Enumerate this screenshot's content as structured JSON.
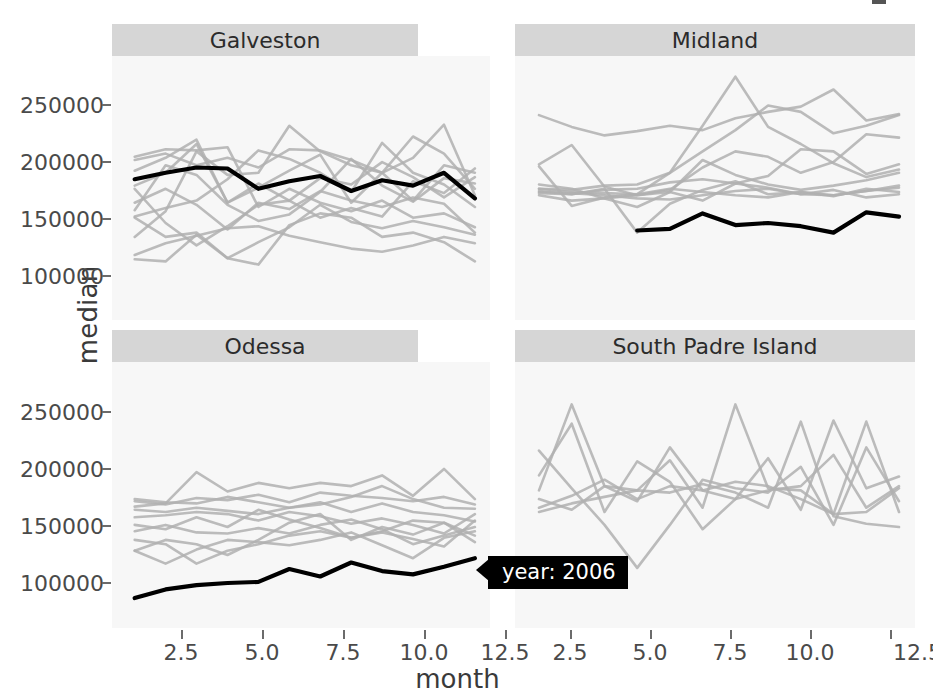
{
  "axes": {
    "ylabel": "median",
    "xlabel": "month",
    "yticks": [
      "250000",
      "200000",
      "150000",
      "100000"
    ],
    "xticks_left": [
      "2.5",
      "5.0",
      "7.5",
      "10.0",
      "12.5"
    ],
    "xticks_right": [
      "2.5",
      "5.0",
      "7.5",
      "10.0",
      "12.5"
    ]
  },
  "tooltip": {
    "label": "year: 2006"
  },
  "panels": [
    {
      "title": "Galveston"
    },
    {
      "title": "Midland"
    },
    {
      "title": "Odessa"
    },
    {
      "title": "South Padre Island"
    }
  ],
  "colors": {
    "highlight": "#000000",
    "background_series": "#b0b0b0",
    "panel_bg": "#f7f7f7",
    "strip_bg": "#d6d6d6",
    "tooltip_bg": "#000000",
    "tooltip_text": "#ffffff",
    "axis_text": "#4a4a4a"
  },
  "chart_data": {
    "type": "line",
    "title": "",
    "xlabel": "month",
    "ylabel": "median",
    "xlim": [
      1,
      12
    ],
    "ylim": [
      55000,
      275000
    ],
    "grid": false,
    "legend_position": "none",
    "facet_layout": "2x2",
    "highlight_series": "year: 2006",
    "annotations": [
      {
        "text": "year: 2006",
        "panel": "Odessa",
        "x": 12,
        "y": 105000
      }
    ],
    "x": [
      1,
      2,
      3,
      4,
      5,
      6,
      7,
      8,
      9,
      10,
      11,
      12
    ],
    "facets": [
      {
        "name": "Galveston",
        "highlight": {
          "name": "2006",
          "values": [
            172000,
            178000,
            183000,
            182000,
            163000,
            170000,
            175000,
            161000,
            171000,
            166000,
            178000,
            154000
          ]
        },
        "series": [
          {
            "name": "2000",
            "values": [
              97000,
              95000,
              120000,
              98000,
              92000,
              129000,
              140000,
              136000,
              118000,
              122000,
              113000,
              95000
            ]
          },
          {
            "name": "2001",
            "values": [
              136000,
              118000,
              122000,
              98000,
              113000,
              127000,
              148000,
              132000,
              126000,
              133000,
              127000,
              120000
            ]
          },
          {
            "name": "2002",
            "values": [
              101000,
              112000,
              119000,
              126000,
              128000,
              119000,
              113000,
              107000,
              104000,
              110000,
              118000,
              112000
            ]
          },
          {
            "name": "2003",
            "values": [
              150000,
              163000,
              148000,
              125000,
              150000,
              144000,
              161000,
              152000,
              146000,
              155000,
              149000,
              122000
            ]
          },
          {
            "name": "2004",
            "values": [
              166000,
              178000,
              205000,
              150000,
              164000,
              180000,
              195000,
              150000,
              178000,
              152000,
              185000,
              178000
            ]
          },
          {
            "name": "2005",
            "values": [
              190000,
              196000,
              185000,
              192000,
              183000,
              200000,
              199000,
              190000,
              178000,
              212000,
              196000,
              163000
            ]
          },
          {
            "name": "2007",
            "values": [
              137000,
              145000,
              152000,
              172000,
              199000,
              191000,
              178000,
              160000,
              206000,
              178000,
              167000,
              146000
            ]
          },
          {
            "name": "2008",
            "values": [
              118000,
              142000,
              198000,
              176000,
              178000,
              222000,
              198000,
              185000,
              178000,
              192000,
              223000,
              157000
            ]
          },
          {
            "name": "2009",
            "values": [
              193000,
              200000,
              199000,
              202000,
              146000,
              163000,
              150000,
              142000,
              152000,
              136000,
              140000,
              127000
            ]
          },
          {
            "name": "2010",
            "values": [
              143000,
              185000,
              176000,
              148000,
              133000,
              139000,
              160000,
              191000,
              166000,
              151000,
              173000,
              168000
            ]
          },
          {
            "name": "2011",
            "values": [
              163000,
              131000,
              110000,
              128000,
              148000,
              152000,
              136000,
              145000,
              137000,
              170000,
              159000,
              182000
            ]
          },
          {
            "name": "2012",
            "values": [
              180000,
              192000,
              209000,
              150000,
              168000,
              152000,
              173000,
              167000,
              188000,
              174000,
              155000,
              174000
            ]
          }
        ]
      },
      {
        "name": "Midland",
        "highlight": {
          "name": "2006",
          "values": [
            null,
            null,
            null,
            124000,
            125500,
            140000,
            129000,
            131000,
            128000,
            122000,
            141000,
            137000
          ]
        },
        "series": [
          {
            "name": "2000",
            "values": [
              163000,
              160000,
              159000,
              158000,
              178000,
              198000,
              218000,
              241000,
              235000,
              215000,
              222000,
              232000
            ]
          },
          {
            "name": "2001",
            "values": [
              232000,
              221000,
              213000,
              217000,
              222000,
              218000,
              229000,
              235000,
              240000,
              256000,
              227000,
              233000
            ]
          },
          {
            "name": "2002",
            "values": [
              186000,
              204000,
              165000,
              157000,
              162000,
              183000,
              198000,
              193000,
              178000,
              188000,
              214000,
              211000
            ]
          },
          {
            "name": "2003",
            "values": [
              163000,
              162000,
              166000,
              167000,
              178000,
              222000,
              268000,
              221000,
              205000,
              187000,
              174000,
              181000
            ]
          },
          {
            "name": "2004",
            "values": [
              167000,
              163000,
              154000,
              146000,
              160000,
              190000,
              176000,
              167000,
              162000,
              166000,
              171000,
              178000
            ]
          },
          {
            "name": "2005",
            "values": [
              161000,
              158000,
              162000,
              163000,
              169000,
              172000,
              168000,
              175000,
              200000,
              198000,
              177000,
              186000
            ]
          },
          {
            "name": "2007",
            "values": [
              160000,
              159000,
              157000,
              154000,
              153000,
              157000,
              161000,
              163000,
              158000,
              157000,
              161000,
              164000
            ]
          },
          {
            "name": "2008",
            "values": [
              184000,
              147000,
              155000,
              158000,
              163000,
              160000,
              157000,
              155000,
              160000,
              156000,
              163000,
              160000
            ]
          },
          {
            "name": "2009",
            "values": [
              159000,
              158000,
              163000,
              122000,
              149000,
              162000,
              170000,
              158000,
              160000,
              157000,
              161000,
              166000
            ]
          },
          {
            "name": "2010",
            "values": [
              157000,
              152000,
              154000,
              157000,
              160000,
              152000,
              168000,
              164000,
              158000,
              162000,
              155000,
              158000
            ]
          }
        ]
      },
      {
        "name": "Odessa",
        "highlight": {
          "name": "2006",
          "values": [
            68000,
            76000,
            80000,
            82000,
            83000,
            95000,
            88000,
            101000,
            93000,
            90000,
            97000,
            105000
          ]
        },
        "series": [
          {
            "name": "2000",
            "values": [
              112000,
              100000,
              113000,
              122000,
              120000,
              117000,
              122000,
              129000,
              117000,
              105000,
              124000,
              130000
            ]
          },
          {
            "name": "2001",
            "values": [
              122000,
              118000,
              100000,
              112000,
              118000,
              126000,
              130000,
              124000,
              129000,
              123000,
              116000,
              140000
            ]
          },
          {
            "name": "2002",
            "values": [
              130000,
              136000,
              129000,
              128000,
              133000,
              128000,
              136000,
              141000,
              132000,
              118000,
              126000,
              134000
            ]
          },
          {
            "name": "2003",
            "values": [
              136000,
              132000,
              143000,
              134000,
              150000,
              141000,
              133000,
              124000,
              130000,
              140000,
              138000,
              126000
            ]
          },
          {
            "name": "2004",
            "values": [
              143000,
              145000,
              148000,
              146000,
              140000,
              148000,
              144000,
              137000,
              142000,
              136000,
              128000,
              146000
            ]
          },
          {
            "name": "2005",
            "values": [
              150000,
              148000,
              152000,
              149000,
              146000,
              152000,
              157000,
              148000,
              156000,
              148000,
              145000,
              139000
            ]
          },
          {
            "name": "2007",
            "values": [
              158000,
              155000,
              161000,
              159000,
              164000,
              157000,
              166000,
              163000,
              161000,
              158000,
              162000,
              155000
            ]
          },
          {
            "name": "2008",
            "values": [
              153000,
              156000,
              185000,
              167000,
              175000,
              170000,
              175000,
              172000,
              182000,
              163000,
              188000,
              160000
            ]
          },
          {
            "name": "2009",
            "values": [
              160000,
              157000,
              156000,
              162000,
              157000,
              152000,
              155000,
              162000,
              172000,
              160000,
              152000,
              151000
            ]
          },
          {
            "name": "2010",
            "values": [
              112000,
              122000,
              118000,
              108000,
              122000,
              138000,
              146000,
              122000,
              134000,
              127000,
              138000,
              120000
            ]
          }
        ]
      },
      {
        "name": "South Padre Island",
        "highlight": null,
        "series": [
          {
            "name": "2000",
            "values": [
              168000,
              248000,
              172000,
              168000,
              196000,
              152000,
              248000,
              170000,
              168000,
              146000,
              232000,
              148000
            ]
          },
          {
            "name": "2001",
            "values": [
              205000,
              170000,
              136000,
              96000,
              136000,
              178000,
              170000,
              166000,
              190000,
              136000,
              208000,
              158000
            ]
          },
          {
            "name": "2002",
            "values": [
              182000,
              230000,
              148000,
              195000,
              176000,
              132000,
              160000,
              168000,
              172000,
              201000,
              152000,
              172000
            ]
          },
          {
            "name": "2003",
            "values": [
              160000,
              150000,
              172000,
              158000,
              208000,
              168000,
              160000,
              198000,
              150000,
              233000,
              170000,
              181000
            ]
          },
          {
            "name": "2004",
            "values": [
              148000,
              156000,
              162000,
              168000,
              166000,
              174000,
              166000,
              152000,
              232000,
              144000,
              137000,
              134000
            ]
          },
          {
            "name": "2005",
            "values": [
              152000,
              163000,
              178000,
              160000,
              172000,
              168000,
              176000,
              172000,
              160000,
              146000,
              148000,
              170000
            ]
          }
        ]
      }
    ]
  }
}
